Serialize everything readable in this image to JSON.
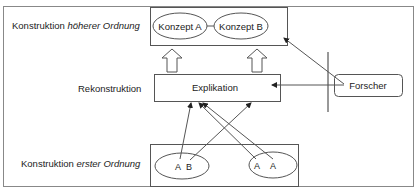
{
  "diagram": {
    "levels": {
      "higher": {
        "prefix": "Konstruktion ",
        "emphasis": "höherer Ordnung"
      },
      "reconstruction": {
        "label": "Rekonstruktion"
      },
      "first": {
        "prefix": "Konstruktion ",
        "emphasis": "erster Ordnung"
      }
    },
    "concepts": {
      "a": "Konzept A",
      "b": "Konzept B"
    },
    "explication": "Explikation",
    "researcher": "Forscher",
    "first_order_groups": [
      {
        "items": [
          "A",
          "B"
        ]
      },
      {
        "items": [
          "A",
          "A"
        ]
      }
    ],
    "colors": {
      "stroke": "#555555",
      "frame": "#888888",
      "text": "#222222",
      "background": "#ffffff"
    }
  }
}
